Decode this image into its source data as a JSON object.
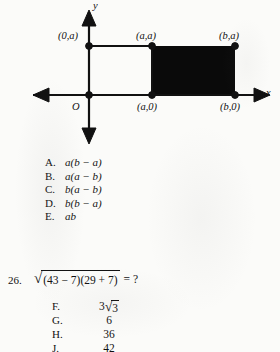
{
  "page": {
    "background_color": "#fbfbf9",
    "ink_color": "#111111"
  },
  "figure": {
    "name": "coordinate-plane-with-shaded-rectangle",
    "axis_labels": {
      "x": "x",
      "y": "y",
      "origin": "O"
    },
    "points": [
      {
        "id": "p-0a",
        "label": "(0,a)",
        "position": "upper-left-on-y-axis"
      },
      {
        "id": "p-aa",
        "label": "(a,a)",
        "position": "upper-middle"
      },
      {
        "id": "p-ba",
        "label": "(b,a)",
        "position": "upper-right"
      },
      {
        "id": "p-a0",
        "label": "(a,0)",
        "position": "lower-middle-on-x-axis"
      },
      {
        "id": "p-b0",
        "label": "(b,0)",
        "position": "lower-right-on-x-axis"
      }
    ],
    "shaded_region": {
      "description": "filled black rectangle from (a,0) to (b,a)",
      "fill_color": "#0a0a0a"
    },
    "open_region": {
      "description": "unshaded rectangle outline from (0,0) to (a,a)",
      "stroke_color": "#111111"
    }
  },
  "choices_1": {
    "name": "answer-choices-question-25",
    "items": [
      {
        "letter": "A.",
        "text": "a(b − a)"
      },
      {
        "letter": "B.",
        "text": "a(a − b)"
      },
      {
        "letter": "C.",
        "text": "b(a − b)"
      },
      {
        "letter": "D.",
        "text": "b(b − a)"
      },
      {
        "letter": "E.",
        "text": "ab"
      }
    ]
  },
  "question_26": {
    "number": "26.",
    "radicand": "(43 − 7)(29 + 7)",
    "radical_symbol": "√",
    "tail": "= ?"
  },
  "choices_2": {
    "name": "answer-choices-question-26",
    "items": [
      {
        "letter": "F.",
        "value_prefix": "3",
        "radical_value": "3",
        "value": ""
      },
      {
        "letter": "G.",
        "value_prefix": "",
        "radical_value": "",
        "value": "6"
      },
      {
        "letter": "H.",
        "value_prefix": "",
        "radical_value": "",
        "value": "36"
      },
      {
        "letter": "J.",
        "value_prefix": "",
        "radical_value": "",
        "value": "42"
      }
    ]
  }
}
